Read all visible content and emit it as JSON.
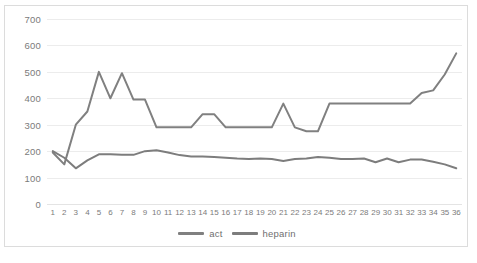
{
  "chart_data": {
    "type": "line",
    "title": "",
    "xlabel": "",
    "ylabel": "",
    "ylim": [
      0,
      700
    ],
    "ytick_step": 100,
    "yticks": [
      0,
      100,
      200,
      300,
      400,
      500,
      600,
      700
    ],
    "grid": true,
    "legend_position": "bottom-center",
    "categories": [
      "1",
      "2",
      "3",
      "4",
      "5",
      "6",
      "7",
      "8",
      "9",
      "10",
      "11",
      "12",
      "13",
      "14",
      "15",
      "16",
      "17",
      "18",
      "19",
      "20",
      "21",
      "22",
      "23",
      "24",
      "25",
      "26",
      "27",
      "28",
      "29",
      "30",
      "31",
      "32",
      "33",
      "34",
      "35",
      "36"
    ],
    "series": [
      {
        "name": "act",
        "color": "#808080",
        "values": [
          195,
          150,
          300,
          350,
          500,
          400,
          495,
          395,
          395,
          290,
          290,
          290,
          290,
          340,
          340,
          290,
          290,
          290,
          290,
          290,
          380,
          290,
          275,
          275,
          380,
          380,
          380,
          380,
          380,
          380,
          380,
          380,
          420,
          430,
          490,
          570
        ]
      },
      {
        "name": "heparin",
        "color": "#7d7d7d",
        "values": [
          200,
          175,
          135,
          165,
          188,
          188,
          186,
          186,
          200,
          203,
          195,
          185,
          180,
          180,
          178,
          175,
          172,
          170,
          172,
          170,
          163,
          170,
          172,
          178,
          175,
          170,
          170,
          172,
          158,
          172,
          158,
          168,
          168,
          160,
          150,
          135
        ]
      }
    ]
  },
  "legend": {
    "items": [
      {
        "label": "act",
        "color": "#808080"
      },
      {
        "label": "heparin",
        "color": "#7d7d7d"
      }
    ]
  },
  "colors": {
    "act_line": "#808080",
    "heparin_line": "#7d7d7d",
    "gridline": "#ececec",
    "axis_text": "#7b7b7b",
    "border": "#dcdcdc",
    "background": "#ffffff"
  }
}
